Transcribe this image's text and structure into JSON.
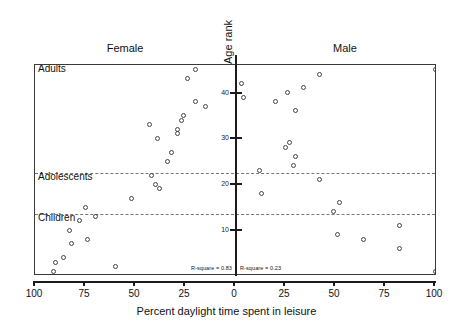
{
  "figure": {
    "panels": [
      {
        "name": "female",
        "label": "Female"
      },
      {
        "name": "male",
        "label": "Male"
      }
    ],
    "yaxis_title": "Age rank",
    "xaxis_title": "Percent daylight time spent in leisure"
  },
  "chart_data": {
    "type": "scatter",
    "title": "",
    "subtitle": "",
    "xlabel": "Percent daylight time spent in leisure",
    "ylabel": "Age rank",
    "grid": false,
    "legend_position": "none",
    "layout": "mirrored dual panel sharing a central vertical Age rank axis; Female panel x decreases left-to-right 100->0, Male panel x increases 0->100",
    "panels": [
      {
        "name": "Female",
        "label": "Female",
        "xlim": [
          100,
          0
        ],
        "xticks": [
          100,
          75,
          50,
          25,
          0
        ],
        "annotation": "R-square = 0.83",
        "r_square": 0.83,
        "points": [
          {
            "x": 91,
            "y": 1
          },
          {
            "x": 90,
            "y": 3
          },
          {
            "x": 86,
            "y": 4
          },
          {
            "x": 60,
            "y": 2
          },
          {
            "x": 82,
            "y": 7
          },
          {
            "x": 74,
            "y": 8
          },
          {
            "x": 83,
            "y": 10
          },
          {
            "x": 78,
            "y": 12
          },
          {
            "x": 70,
            "y": 13
          },
          {
            "x": 75,
            "y": 15
          },
          {
            "x": 52,
            "y": 17
          },
          {
            "x": 38,
            "y": 19
          },
          {
            "x": 40,
            "y": 20
          },
          {
            "x": 42,
            "y": 22
          },
          {
            "x": 34,
            "y": 25
          },
          {
            "x": 32,
            "y": 27
          },
          {
            "x": 39,
            "y": 30
          },
          {
            "x": 29,
            "y": 31
          },
          {
            "x": 29,
            "y": 32
          },
          {
            "x": 43,
            "y": 33
          },
          {
            "x": 27,
            "y": 34
          },
          {
            "x": 26,
            "y": 35
          },
          {
            "x": 15,
            "y": 37
          },
          {
            "x": 20,
            "y": 38
          },
          {
            "x": 24,
            "y": 43
          },
          {
            "x": 20,
            "y": 45
          }
        ]
      },
      {
        "name": "Male",
        "label": "Male",
        "xlim": [
          0,
          100
        ],
        "xticks": [
          0,
          25,
          50,
          75,
          100
        ],
        "annotation": "R-square = 0.23",
        "r_square": 0.23,
        "points": [
          {
            "x": 100,
            "y": 1
          },
          {
            "x": 82,
            "y": 6
          },
          {
            "x": 64,
            "y": 8
          },
          {
            "x": 51,
            "y": 9
          },
          {
            "x": 82,
            "y": 11
          },
          {
            "x": 49,
            "y": 14
          },
          {
            "x": 52,
            "y": 16
          },
          {
            "x": 13,
            "y": 18
          },
          {
            "x": 42,
            "y": 21
          },
          {
            "x": 12,
            "y": 23
          },
          {
            "x": 29,
            "y": 24
          },
          {
            "x": 30,
            "y": 26
          },
          {
            "x": 25,
            "y": 28
          },
          {
            "x": 27,
            "y": 29
          },
          {
            "x": 30,
            "y": 36
          },
          {
            "x": 20,
            "y": 38
          },
          {
            "x": 4,
            "y": 39
          },
          {
            "x": 26,
            "y": 40
          },
          {
            "x": 34,
            "y": 41
          },
          {
            "x": 3,
            "y": 42
          },
          {
            "x": 42,
            "y": 44
          },
          {
            "x": 100,
            "y": 45
          }
        ]
      }
    ],
    "yaxis": {
      "label": "Age rank",
      "ylim": [
        0,
        46
      ],
      "yticks": [
        10,
        20,
        30,
        40
      ],
      "ytick_labels": [
        "10",
        "20",
        "30",
        "40"
      ]
    },
    "reference_lines": [
      {
        "label": "Adolescents",
        "y": 22.5,
        "style": "dashed"
      },
      {
        "label": "Children",
        "y": 13.5,
        "style": "dashed"
      }
    ],
    "category_labels": [
      {
        "label": "Adults",
        "y": 45.2
      },
      {
        "label": "Adolescents",
        "y": 21.6
      },
      {
        "label": "Children",
        "y": 12.6
      }
    ]
  }
}
